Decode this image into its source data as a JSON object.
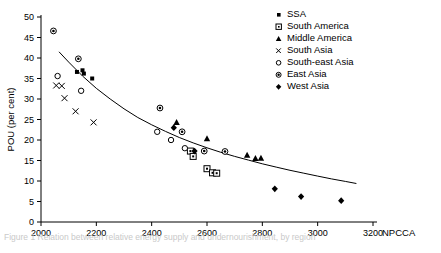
{
  "chart_data": {
    "type": "scatter",
    "title": "",
    "xlabel": "NPCCA",
    "ylabel": "POU (per cent)",
    "xlim": [
      2000,
      3200
    ],
    "ylim": [
      0,
      50
    ],
    "xticks": [
      2000,
      2200,
      2400,
      2600,
      2800,
      3000,
      3200
    ],
    "yticks": [
      0,
      5,
      10,
      15,
      20,
      25,
      30,
      35,
      40,
      45,
      50
    ],
    "grid": false,
    "legend_position": "top-right",
    "series": [
      {
        "name": "SSA",
        "marker": "filled-square",
        "points": [
          [
            2130,
            36.6
          ],
          [
            2150,
            37.0
          ],
          [
            2155,
            36.2
          ],
          [
            2185,
            35.0
          ]
        ]
      },
      {
        "name": "South America",
        "marker": "open-square-dot",
        "points": [
          [
            2540,
            17.3
          ],
          [
            2550,
            16.0
          ],
          [
            2600,
            13.0
          ],
          [
            2620,
            12.0
          ],
          [
            2635,
            11.9
          ]
        ]
      },
      {
        "name": "Middle America",
        "marker": "filled-triangle",
        "points": [
          [
            2490,
            24.3
          ],
          [
            2600,
            20.3
          ],
          [
            2745,
            16.3
          ],
          [
            2775,
            15.5
          ],
          [
            2795,
            15.6
          ]
        ]
      },
      {
        "name": "South Asia",
        "marker": "x",
        "points": [
          [
            2055,
            33.3
          ],
          [
            2075,
            33.2
          ],
          [
            2085,
            30.2
          ],
          [
            2125,
            27.0
          ],
          [
            2190,
            24.3
          ]
        ]
      },
      {
        "name": "South-east Asia",
        "marker": "open-circle",
        "points": [
          [
            2060,
            35.6
          ],
          [
            2145,
            32.0
          ],
          [
            2420,
            22.0
          ],
          [
            2470,
            20.0
          ],
          [
            2520,
            18.0
          ]
        ]
      },
      {
        "name": "East Asia",
        "marker": "circle-dot",
        "points": [
          [
            2045,
            46.6
          ],
          [
            2135,
            39.8
          ],
          [
            2430,
            27.8
          ],
          [
            2510,
            22.0
          ],
          [
            2590,
            17.3
          ],
          [
            2665,
            17.2
          ]
        ]
      },
      {
        "name": "West Asia",
        "marker": "filled-diamond",
        "points": [
          [
            2480,
            23.0
          ],
          [
            2555,
            17.3
          ],
          [
            2845,
            8.1
          ],
          [
            2940,
            6.2
          ],
          [
            3085,
            5.2
          ]
        ]
      }
    ],
    "fit_curve": {
      "name": "fitted trend",
      "points": [
        [
          2065,
          41.5
        ],
        [
          2100,
          39.0
        ],
        [
          2150,
          35.6
        ],
        [
          2200,
          32.6
        ],
        [
          2250,
          30.0
        ],
        [
          2300,
          27.6
        ],
        [
          2350,
          25.5
        ],
        [
          2400,
          23.7
        ],
        [
          2450,
          22.1
        ],
        [
          2500,
          20.6
        ],
        [
          2550,
          19.3
        ],
        [
          2600,
          18.1
        ],
        [
          2650,
          17.0
        ],
        [
          2700,
          16.0
        ],
        [
          2750,
          15.1
        ],
        [
          2800,
          14.2
        ],
        [
          2850,
          13.4
        ],
        [
          2900,
          12.6
        ],
        [
          2950,
          11.9
        ],
        [
          3000,
          11.2
        ],
        [
          3050,
          10.5
        ],
        [
          3100,
          9.9
        ],
        [
          3140,
          9.4
        ]
      ]
    }
  },
  "legend": {
    "items": [
      {
        "label": "SSA",
        "marker": "filled-square-icon"
      },
      {
        "label": "South America",
        "marker": "open-square-dot-icon"
      },
      {
        "label": "Middle America",
        "marker": "filled-triangle-icon"
      },
      {
        "label": "South Asia",
        "marker": "x-icon"
      },
      {
        "label": "South-east Asia",
        "marker": "open-circle-icon"
      },
      {
        "label": "East Asia",
        "marker": "circle-dot-icon"
      },
      {
        "label": "West Asia",
        "marker": "filled-diamond-icon"
      }
    ]
  },
  "caption": {
    "text": "Figure 1  Relation between relative energy supply and undernourishment, by region"
  },
  "colors": {
    "marker": "#000000",
    "axis": "#000000",
    "background": "#ffffff"
  }
}
